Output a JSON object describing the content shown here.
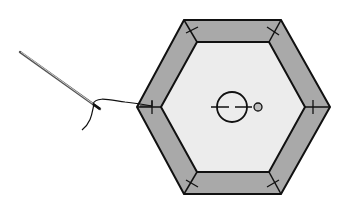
{
  "diagram": {
    "colors": {
      "background": "#ffffff",
      "border_fill": "#a9a9a9",
      "center_fill": "#ececec",
      "stroke": "#111111",
      "needle": "#9a9a9a"
    },
    "elements": [
      {
        "name": "outer-hexagon",
        "shape": "hexagon"
      },
      {
        "name": "inner-hexagon",
        "shape": "hexagon"
      },
      {
        "name": "center-circle",
        "shape": "circle"
      },
      {
        "name": "small-circle",
        "shape": "circle"
      },
      {
        "name": "needle",
        "shape": "line"
      },
      {
        "name": "thread",
        "shape": "curve"
      },
      {
        "name": "tack-stitches",
        "count": 6
      }
    ]
  }
}
